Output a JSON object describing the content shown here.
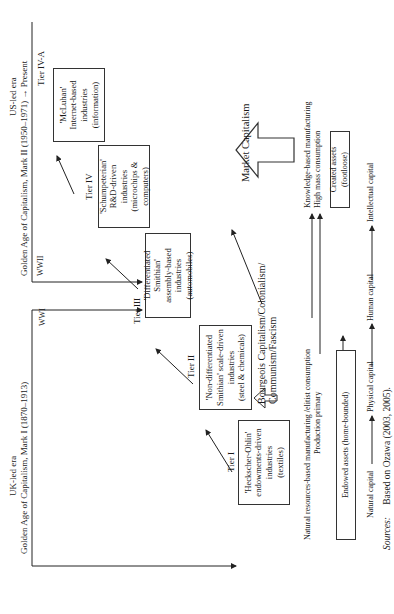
{
  "eras": {
    "uk": {
      "label": "UK-led era",
      "period": "Golden Age of Capitalism, Mark I (1870–1913)",
      "end_marker": "WWI"
    },
    "us": {
      "label": "US-led era",
      "period": "Golden Age of Capitalism, Mark II (1950–1971) → Present",
      "start_marker": "WWII"
    }
  },
  "tiers": [
    {
      "tier": "Tier I",
      "line1": "'Heckscher-Ohlin'",
      "line2": "endowments-driven",
      "line3": "industries",
      "line4": "(textiles)"
    },
    {
      "tier": "Tier II",
      "line1": "'Non-differentiated",
      "line2": "Smithian' scale-driven",
      "line3": "industries",
      "line4": "(steel & chemicals)"
    },
    {
      "tier": "Tier III",
      "line1": "'Differentiated Smithian'",
      "line2": "assembly-based",
      "line3": "industries",
      "line4": "(automobiles)"
    },
    {
      "tier": "Tier IV",
      "line1": "'Schumpeterian'",
      "line2": "R&D-driven",
      "line3": "industries",
      "line4": "(microchips &",
      "line5": "computers)"
    },
    {
      "tier": "Tier IV-A",
      "line1": "'McLuhan'",
      "line2": "Internet-based",
      "line3": "industries",
      "line4": "(information)"
    }
  ],
  "systems": {
    "bourgeois_line1": "Bourgeois Capitalism/Colonialism/",
    "bourgeois_line2": "Communism/Fascism",
    "market": "Market Capitalism"
  },
  "production": {
    "natural_line1": "Natural resources-based manufacturing /elitist consumption",
    "natural_line2": "Production primary",
    "knowledge_line1": "Knowledge-based manufacturing",
    "knowledge_line2": "High mass consumption"
  },
  "assets": {
    "endowed": "Endowed assets (home-bounded)",
    "created": "Created assets (footloose)"
  },
  "capital_chain": [
    "Natural capital",
    "Physical capital",
    "Human capital",
    "Intellectual capital"
  ],
  "source": {
    "label": "Sources:",
    "text": "Based on Ozawa (2003, 2005)."
  }
}
